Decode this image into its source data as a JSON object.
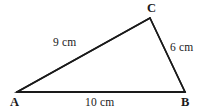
{
  "figure": {
    "type": "geometry-diagram",
    "shape": "triangle",
    "background_color": "#ffffff",
    "stroke_color": "#1a1a1a",
    "text_color": "#1a1a1a",
    "width": 207,
    "height": 112
  },
  "vertices": [
    {
      "id": "A",
      "label": "A",
      "x": 17,
      "y": 92
    },
    {
      "id": "B",
      "label": "B",
      "x": 185,
      "y": 92
    },
    {
      "id": "C",
      "label": "C",
      "x": 150,
      "y": 18
    }
  ],
  "sides": [
    {
      "id": "AC",
      "from": "A",
      "to": "C",
      "label": "9 cm",
      "length": 9,
      "unit": "cm"
    },
    {
      "id": "CB",
      "from": "C",
      "to": "B",
      "label": "6 cm",
      "length": 6,
      "unit": "cm"
    },
    {
      "id": "AB",
      "from": "A",
      "to": "B",
      "label": "10 cm",
      "length": 10,
      "unit": "cm"
    }
  ]
}
